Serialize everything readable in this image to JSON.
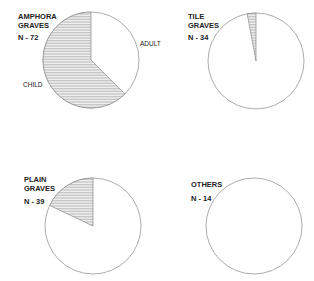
{
  "chart_data": [
    {
      "type": "pie",
      "title": [
        "AMPHORA",
        "GRAVES"
      ],
      "n_label": "N - 72",
      "n": 72,
      "slices": [
        {
          "name": "ADULT",
          "value": 27,
          "pattern": "plain"
        },
        {
          "name": "CHILD",
          "value": 45,
          "pattern": "hatched"
        }
      ]
    },
    {
      "type": "pie",
      "title": [
        "TILE",
        "GRAVES"
      ],
      "n_label": "N - 34",
      "n": 34,
      "slices": [
        {
          "name": "ADULT",
          "value": 33,
          "pattern": "plain"
        },
        {
          "name": "CHILD",
          "value": 1,
          "pattern": "hatched"
        }
      ]
    },
    {
      "type": "pie",
      "title": [
        "PLAIN",
        "GRAVES"
      ],
      "n_label": "N - 39",
      "n": 39,
      "slices": [
        {
          "name": "ADULT",
          "value": 32,
          "pattern": "plain"
        },
        {
          "name": "CHILD",
          "value": 7,
          "pattern": "hatched"
        }
      ]
    },
    {
      "type": "pie",
      "title": [
        "OTHERS"
      ],
      "n_label": "N - 14",
      "n": 14,
      "slices": [
        {
          "name": "ADULT",
          "value": 14,
          "pattern": "plain"
        },
        {
          "name": "CHILD",
          "value": 0,
          "pattern": "hatched"
        }
      ]
    }
  ],
  "labels": {
    "adult": "ADULT",
    "child": "CHILD"
  },
  "colors": {
    "outline": "#888888",
    "hatch": "#999999",
    "text": "#222222"
  }
}
